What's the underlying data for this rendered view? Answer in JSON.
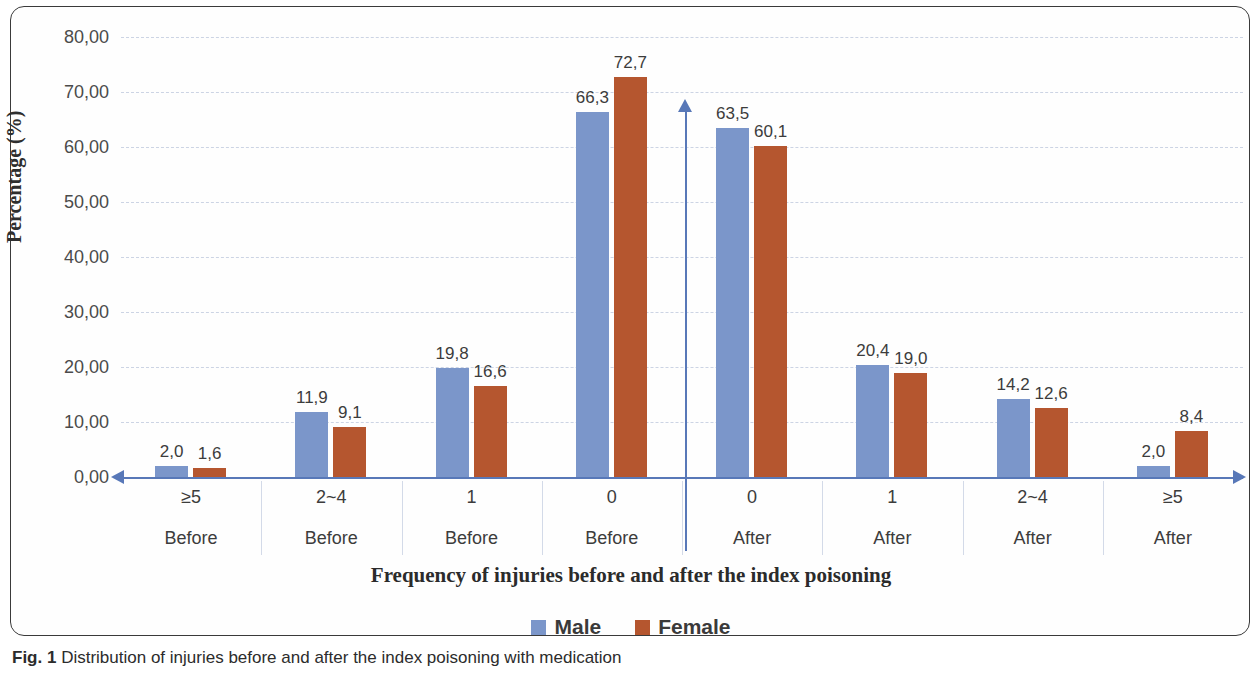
{
  "caption": {
    "bold": "Fig. 1",
    "text": "Distribution of injuries before and after the index poisoning with medication"
  },
  "legend": {
    "position": "bottom-center",
    "items": [
      {
        "label": "Male",
        "color": "#7b96ca"
      },
      {
        "label": "Female",
        "color": "#b5562f"
      }
    ]
  },
  "chart_data": {
    "type": "bar",
    "title": "",
    "xlabel": "Frequency of injuries before and after the index poisoning",
    "ylabel": "Percentage (%)",
    "ylim": [
      0,
      80
    ],
    "ytick_labels": [
      "80,00",
      "70,00",
      "60,00",
      "50,00",
      "40,00",
      "30,00",
      "20,00",
      "10,00",
      "0,00"
    ],
    "ytick_values": [
      80,
      70,
      60,
      50,
      40,
      30,
      20,
      10,
      0
    ],
    "grid": true,
    "categories": [
      "≥5",
      "2~4",
      "1",
      "0",
      "0",
      "1",
      "2~4",
      "≥5"
    ],
    "category_sublabels": [
      "Before",
      "Before",
      "Before",
      "Before",
      "After",
      "After",
      "After",
      "After"
    ],
    "series": [
      {
        "name": "Male",
        "color": "#7b96ca",
        "values": [
          2.0,
          11.9,
          19.8,
          66.3,
          63.5,
          20.4,
          14.2,
          2.0
        ],
        "labels": [
          "2,0",
          "11,9",
          "19,8",
          "66,3",
          "63,5",
          "20,4",
          "14,2",
          "2,0"
        ]
      },
      {
        "name": "Female",
        "color": "#b5562f",
        "values": [
          1.6,
          9.1,
          16.6,
          72.7,
          60.1,
          19.0,
          12.6,
          8.4
        ],
        "labels": [
          "1,6",
          "9,1",
          "16,6",
          "72,7",
          "60,1",
          "19,0",
          "12,6",
          "8,4"
        ]
      }
    ],
    "annotations": {
      "center_divider": "vertical axis arrow separating Before and After"
    }
  }
}
